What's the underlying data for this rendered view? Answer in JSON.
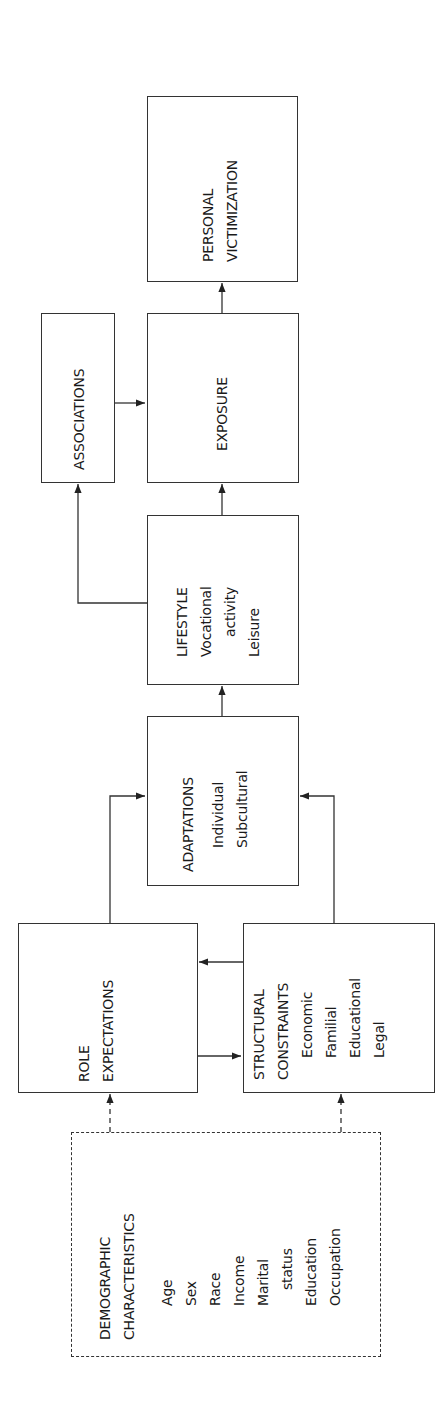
{
  "diagram": {
    "type": "flowchart",
    "orientation": "rotated -90deg (reads bottom-to-top)",
    "nodes": {
      "demographic": {
        "title_lines": [
          "DEMOGRAPHIC",
          "CHARACTERISTICS"
        ],
        "items": [
          "Age",
          "Sex",
          "Race",
          "Income",
          "Marital",
          "status",
          "Education",
          "Occupation"
        ],
        "style": "dashed"
      },
      "role_expectations": {
        "title_lines": [
          "ROLE",
          "EXPECTATIONS"
        ]
      },
      "structural_constraints": {
        "title_lines": [
          "STRUCTURAL",
          "CONSTRAINTS"
        ],
        "items": [
          "Economic",
          "Familial",
          "Educational",
          "Legal"
        ]
      },
      "adaptations": {
        "title": "ADAPTATIONS",
        "items": [
          "Individual",
          "Subcultural"
        ]
      },
      "lifestyle": {
        "title": "LIFESTYLE",
        "items": [
          "Vocational",
          "activity",
          "Leisure"
        ]
      },
      "associations": {
        "title": "ASSOCIATIONS"
      },
      "exposure": {
        "title": "EXPOSURE"
      },
      "personal_victimization": {
        "title_lines": [
          "PERSONAL",
          "VICTIMIZATION"
        ]
      }
    },
    "edges": [
      {
        "from": "demographic",
        "to": "role_expectations",
        "style": "dashed"
      },
      {
        "from": "demographic",
        "to": "structural_constraints",
        "style": "dashed"
      },
      {
        "from": "role_expectations",
        "to": "structural_constraints",
        "style": "solid"
      },
      {
        "from": "structural_constraints",
        "to": "role_expectations",
        "style": "solid"
      },
      {
        "from": "role_expectations",
        "to": "adaptations",
        "style": "solid"
      },
      {
        "from": "structural_constraints",
        "to": "adaptations",
        "style": "solid"
      },
      {
        "from": "adaptations",
        "to": "lifestyle",
        "style": "solid"
      },
      {
        "from": "lifestyle",
        "to": "associations",
        "style": "solid"
      },
      {
        "from": "lifestyle",
        "to": "exposure",
        "style": "solid"
      },
      {
        "from": "associations",
        "to": "exposure",
        "style": "solid"
      },
      {
        "from": "exposure",
        "to": "personal_victimization",
        "style": "solid"
      }
    ],
    "colors": {
      "line": "#333333",
      "text": "#1a1a1a",
      "background": "#ffffff"
    }
  }
}
